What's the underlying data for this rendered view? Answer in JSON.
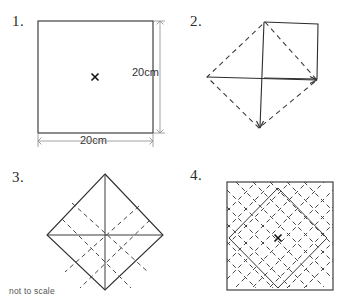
{
  "document": {
    "title": "Rotational symmetry worksheet figures",
    "note": "not to scale",
    "paper_color": "#ffffff",
    "ink_color": "#2e2e2e",
    "dashed_ink_color": "#3d3d3d",
    "dimension_ink_color": "#8a8a8a"
  },
  "figures": [
    {
      "number": "1.",
      "name": "square-with-centre-mark",
      "shape": "square",
      "centre_mark": "x",
      "dimensions": {
        "width_label": "20cm",
        "height_label": "20cm"
      },
      "square": {
        "left": 38,
        "top": 21,
        "right": 153,
        "bottom": 133
      },
      "centre": {
        "x": 95,
        "y": 77
      }
    },
    {
      "number": "2.",
      "name": "rotated-square-with-arrows",
      "shape": "diamond-dashed-with-solid-square",
      "diamond_vertices": {
        "top": {
          "x": 265,
          "y": 22
        },
        "right": {
          "x": 317,
          "y": 80
        },
        "bottom": {
          "x": 259,
          "y": 128
        },
        "left": {
          "x": 207,
          "y": 77
        }
      },
      "solid_square": {
        "left": 264,
        "top": 22,
        "right": 318,
        "bottom": 79
      },
      "arrows": [
        "down",
        "right"
      ],
      "centre": {
        "x": 264,
        "y": 78
      }
    },
    {
      "number": "3.",
      "name": "diamond-with-dashed-overlay",
      "shape": "solid-diamond-with-dashed-square",
      "diamond_vertices": {
        "top": {
          "x": 105,
          "y": 174
        },
        "right": {
          "x": 163,
          "y": 235
        },
        "bottom": {
          "x": 105,
          "y": 290
        },
        "left": {
          "x": 47,
          "y": 235
        }
      },
      "centre": {
        "x": 105,
        "y": 235
      },
      "dashed_line_count": 4
    },
    {
      "number": "4.",
      "name": "square-with-dashed-lattice",
      "shape": "square-with-rotated-lattice",
      "square": {
        "left": 227,
        "top": 182,
        "right": 333,
        "bottom": 290
      },
      "centre_mark": "x",
      "centre": {
        "x": 278,
        "y": 238
      },
      "inner_diamond_half_diagonal": 48,
      "lattice_spacing": 17
    }
  ]
}
